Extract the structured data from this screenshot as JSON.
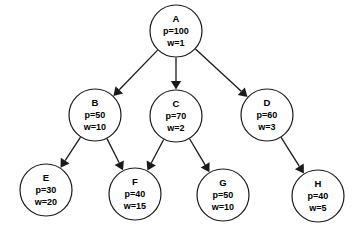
{
  "diagram": {
    "type": "directed-acyclic-graph",
    "title": "",
    "background_color": "#ffffff",
    "stroke_color": "#1a1a1a",
    "node_fill_color": "#ffffff",
    "attribute_keys": [
      "p",
      "w"
    ],
    "nodes": [
      {
        "id": "A",
        "label": "A",
        "p_label": "p=100",
        "w_label": "w=1",
        "p": 100,
        "w": 1,
        "cx": 176,
        "cy": 31,
        "r": 26
      },
      {
        "id": "B",
        "label": "B",
        "p_label": "p=50",
        "w_label": "w=10",
        "p": 50,
        "w": 10,
        "cx": 95,
        "cy": 115,
        "r": 26
      },
      {
        "id": "C",
        "label": "C",
        "p_label": "p=70",
        "w_label": "w=2",
        "p": 70,
        "w": 2,
        "cx": 176,
        "cy": 116,
        "r": 26
      },
      {
        "id": "D",
        "label": "D",
        "p_label": "p=60",
        "w_label": "w=3",
        "p": 60,
        "w": 3,
        "cx": 267,
        "cy": 115,
        "r": 26
      },
      {
        "id": "E",
        "label": "E",
        "p_label": "p=30",
        "w_label": "w=20",
        "p": 30,
        "w": 20,
        "cx": 46,
        "cy": 190,
        "r": 26
      },
      {
        "id": "F",
        "label": "F",
        "p_label": "p=40",
        "w_label": "w=15",
        "p": 40,
        "w": 15,
        "cx": 135,
        "cy": 194,
        "r": 26
      },
      {
        "id": "G",
        "label": "G",
        "p_label": "p=50",
        "w_label": "w=10",
        "p": 50,
        "w": 10,
        "cx": 223,
        "cy": 195,
        "r": 26
      },
      {
        "id": "H",
        "label": "H",
        "p_label": "p=40",
        "w_label": "w=5",
        "p": 40,
        "w": 5,
        "cx": 318,
        "cy": 196,
        "r": 26
      }
    ],
    "edges": [
      {
        "from": "A",
        "to": "B",
        "directed": true
      },
      {
        "from": "A",
        "to": "C",
        "directed": true
      },
      {
        "from": "A",
        "to": "D",
        "directed": true
      },
      {
        "from": "B",
        "to": "E",
        "directed": true
      },
      {
        "from": "B",
        "to": "F",
        "directed": true
      },
      {
        "from": "C",
        "to": "F",
        "directed": true
      },
      {
        "from": "C",
        "to": "G",
        "directed": true
      },
      {
        "from": "D",
        "to": "H",
        "directed": true
      }
    ]
  }
}
